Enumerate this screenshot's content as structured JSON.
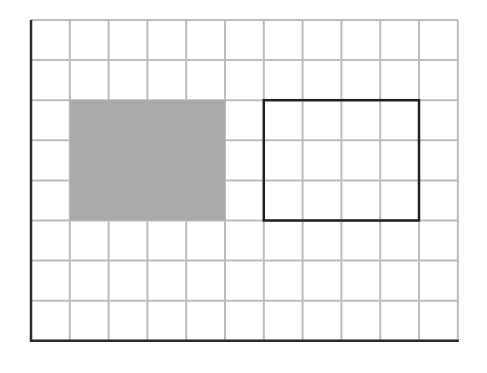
{
  "diagram": {
    "type": "grid",
    "columns": 11,
    "rows": 8,
    "origin": {
      "x": 31,
      "y": 20
    },
    "cell_width": 38.8,
    "cell_height": 40.1,
    "colors": {
      "grid_line": "#bdbdbd",
      "axis_line": "#2b2b2b",
      "shaded_fill": "#a9a9a9",
      "outline": "#222222",
      "background": "#ffffff"
    },
    "shapes": [
      {
        "name": "shaded-rectangle",
        "style": "filled",
        "col_start": 1,
        "row_start": 2,
        "cols": 4,
        "rows": 3
      },
      {
        "name": "outlined-rectangle",
        "style": "outline",
        "col_start": 6,
        "row_start": 2,
        "cols": 4,
        "rows": 3
      }
    ]
  }
}
